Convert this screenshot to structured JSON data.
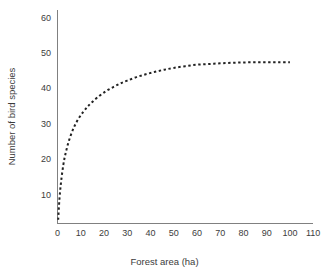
{
  "chart_data": {
    "type": "line",
    "title": "",
    "subtitle": "",
    "xlabel": "Forest area (ha)",
    "ylabel": "Number of bird species",
    "xlim": [
      -2,
      113
    ],
    "ylim": [
      2,
      62
    ],
    "xticks": [
      0,
      10,
      20,
      30,
      40,
      50,
      60,
      70,
      80,
      90,
      100,
      110
    ],
    "yticks": [
      10,
      20,
      30,
      40,
      50,
      60
    ],
    "xtick_labels": [
      "0",
      "10",
      "20",
      "30",
      "40",
      "50",
      "60",
      "70",
      "80",
      "90",
      "100",
      "110"
    ],
    "ytick_labels": [
      "10",
      "20",
      "30",
      "40",
      "50",
      "60"
    ],
    "grid": false,
    "legend": false,
    "legend_position": "none",
    "series": [
      {
        "name": "species-area curve",
        "style": "dotted",
        "color": "#222222",
        "x": [
          0.3,
          0.8,
          1.5,
          2.5,
          3.5,
          5,
          7,
          9,
          11,
          13,
          15,
          18,
          21,
          24,
          27,
          30,
          34,
          38,
          42,
          46,
          50,
          55,
          60,
          65,
          70,
          75,
          80,
          85,
          90,
          95,
          100
        ],
        "y": [
          3.0,
          8.5,
          13.5,
          18.5,
          21.8,
          25.5,
          29.0,
          31.5,
          33.4,
          35.0,
          36.3,
          38.0,
          39.4,
          40.5,
          41.5,
          42.3,
          43.3,
          44.1,
          44.8,
          45.4,
          45.9,
          46.4,
          46.8,
          47.0,
          47.2,
          47.35,
          47.45,
          47.5,
          47.5,
          47.5,
          47.5
        ]
      }
    ],
    "axis_color": "#808080",
    "line_color": "#222222",
    "background_color": "#ffffff"
  }
}
